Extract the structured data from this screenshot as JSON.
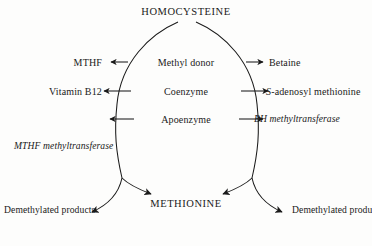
{
  "diagram": {
    "background_color": "#fdfdfc",
    "line_color": "#1a1a1a",
    "nodes": {
      "top": "HOMOCYSTEINE",
      "bottom": "METHIONINE"
    },
    "rows": [
      {
        "role": "Methyl donor",
        "left_reagent": "MTHF",
        "right_reagent": "Betaine"
      },
      {
        "role": "Coenzyme",
        "left_reagent": "Vitamin B12",
        "right_reagent_prefix": "S",
        "right_reagent": "-adenosyl methionine"
      },
      {
        "role": "Apoenzyme",
        "left_reagent": "",
        "right_reagent": ""
      }
    ],
    "enzymes": {
      "left": "MTHF methyltransferase",
      "right": "BH methyltransferase"
    },
    "products": {
      "left": "Demethylated products",
      "right": "Demethylated products"
    }
  }
}
